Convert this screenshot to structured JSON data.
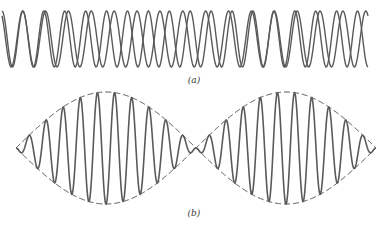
{
  "figure": {
    "panel_a": {
      "label": "(a)",
      "description": "Two sinusoids of slightly different frequency superimposed",
      "x_start": 2,
      "x_end": 368,
      "center_y": 39,
      "amplitude": 28,
      "wave1_cycles": 16,
      "wave2_cycles": 17.5,
      "line_color": "#555555"
    },
    "panel_b": {
      "label": "(b)",
      "description": "Resultant beat waveform with dashed amplitude envelope",
      "x_start": 16,
      "x_end": 376,
      "center_y": 148,
      "amplitude": 56,
      "carrier_cycles": 21,
      "envelope_lobes": 2,
      "line_color": "#555555",
      "envelope_color": "#444444"
    }
  }
}
